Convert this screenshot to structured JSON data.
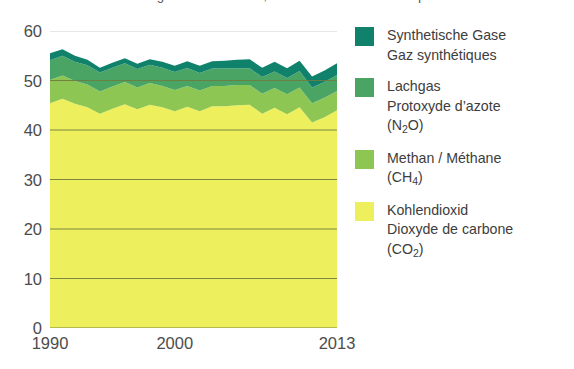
{
  "title": "Emissionen von Treibhausgasen nach Gasen, in Millionen de tonnes d'équivalents",
  "chart_data": {
    "type": "area",
    "stacked": true,
    "title": "Emissionen von Treibhausgasen nach Gasen, in Millionen de tonnes d'équivalents",
    "xlabel": "",
    "ylabel": "",
    "xlim": [
      1990,
      2013
    ],
    "ylim": [
      0,
      60
    ],
    "yticks": [
      0,
      10,
      20,
      30,
      40,
      50,
      60
    ],
    "xticks": [
      1990,
      2000,
      2013
    ],
    "xtick_labels": [
      "1990",
      "2000",
      "2013"
    ],
    "grid": true,
    "grid_axis": "y",
    "legend_position": "right",
    "x": [
      1990,
      1991,
      1992,
      1993,
      1994,
      1995,
      1996,
      1997,
      1998,
      1999,
      2000,
      2001,
      2002,
      2003,
      2004,
      2005,
      2006,
      2007,
      2008,
      2009,
      2010,
      2011,
      2012,
      2013
    ],
    "series": [
      {
        "name": "Kohlendioxid / Dioxyde de carbone (CO2)",
        "color": "#EDEF5C",
        "values": [
          45.4,
          46.3,
          45.3,
          44.6,
          43.3,
          44.3,
          45.2,
          44.2,
          45.1,
          44.6,
          43.8,
          44.7,
          43.8,
          44.8,
          44.8,
          45.0,
          45.1,
          43.3,
          44.5,
          43.2,
          44.6,
          41.5,
          42.6,
          44.0
        ]
      },
      {
        "name": "Methan / Méthane (CH4)",
        "color": "#8DC653",
        "values": [
          4.7,
          4.7,
          4.6,
          4.6,
          4.5,
          4.5,
          4.5,
          4.4,
          4.4,
          4.3,
          4.3,
          4.2,
          4.2,
          4.1,
          4.1,
          4.1,
          4.0,
          4.0,
          4.0,
          4.0,
          4.0,
          3.9,
          3.9,
          3.9
        ]
      },
      {
        "name": "Lachgas / Protoxyde d'azote (N2O)",
        "color": "#4AA564",
        "values": [
          4.0,
          4.0,
          3.9,
          3.9,
          3.8,
          3.8,
          3.8,
          3.7,
          3.7,
          3.7,
          3.6,
          3.6,
          3.5,
          3.5,
          3.5,
          3.4,
          3.4,
          3.4,
          3.3,
          3.3,
          3.3,
          3.2,
          3.2,
          3.2
        ]
      },
      {
        "name": "Synthetische Gase / Gaz synthétiques",
        "color": "#10826B",
        "values": [
          1.4,
          1.3,
          1.2,
          1.1,
          1.0,
          1.0,
          1.0,
          1.1,
          1.1,
          1.2,
          1.3,
          1.4,
          1.5,
          1.5,
          1.6,
          1.7,
          1.8,
          1.9,
          2.0,
          2.0,
          2.1,
          2.2,
          2.3,
          2.4
        ]
      }
    ],
    "totals": [
      55.5,
      56.3,
      55.0,
      54.2,
      52.6,
      53.6,
      54.5,
      53.4,
      54.3,
      53.8,
      53.0,
      53.9,
      53.0,
      53.9,
      54.0,
      54.2,
      54.3,
      52.6,
      53.8,
      52.5,
      54.0,
      50.8,
      52.0,
      53.5
    ]
  },
  "y_axis": {
    "ticks": [
      "60",
      "50",
      "40",
      "30",
      "20",
      "10",
      "0"
    ]
  },
  "x_axis": {
    "ticks": [
      "1990",
      "2000",
      "2013"
    ]
  },
  "legend": {
    "items": [
      {
        "color": "#10826B",
        "line1": "Synthetische Gase",
        "line2": "Gaz synthétiques",
        "line3": ""
      },
      {
        "color": "#4AA564",
        "line1": "Lachgas",
        "line2": "Protoxyde d’azote",
        "line3": "(N",
        "sub": "2",
        "line3b": "O)"
      },
      {
        "color": "#8DC653",
        "line1": "Methan / Méthane",
        "line2": "(CH",
        "sub": "4",
        "line2b": ")",
        "line3": ""
      },
      {
        "color": "#EDEF5C",
        "line1": "Kohlendioxid",
        "line2": "Dioxyde de carbone",
        "line3": "(CO",
        "sub": "2",
        "line3b": ")"
      }
    ]
  }
}
